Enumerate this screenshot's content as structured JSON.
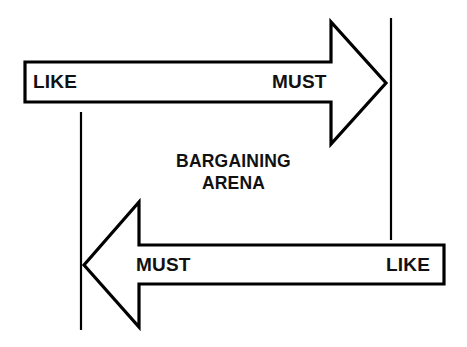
{
  "diagram": {
    "title": "Bargaining Arena",
    "center_label": {
      "line1": "BARGAINING",
      "line2": "ARENA"
    },
    "colors": {
      "stroke": "#000000",
      "fill": "#ffffff",
      "background": "#ffffff",
      "text": "#111111"
    },
    "boundaries": [
      {
        "name": "left-boundary-line",
        "x": 81,
        "y_top": 112,
        "y_bottom": 330
      },
      {
        "name": "right-boundary-line",
        "x": 391,
        "y_top": 18,
        "y_bottom": 240
      }
    ],
    "arrows": [
      {
        "name": "top-arrow",
        "direction": "right",
        "start_label": "LIKE",
        "end_label": "MUST",
        "tail_left": 25,
        "tail_top": 62,
        "tail_bottom": 102,
        "head_base_x": 331,
        "head_top": 22,
        "head_bottom": 144,
        "tip_x": 386,
        "tip_y": 83
      },
      {
        "name": "bottom-arrow",
        "direction": "left",
        "start_label": "LIKE",
        "end_label": "MUST",
        "tail_right": 444,
        "tail_top": 245,
        "tail_bottom": 284,
        "head_base_x": 139,
        "head_top": 202,
        "head_bottom": 327,
        "tip_x": 84,
        "tip_y": 265
      }
    ],
    "labels": {
      "like_top": "LIKE",
      "must_top": "MUST",
      "must_bottom": "MUST",
      "like_bottom": "LIKE"
    }
  }
}
